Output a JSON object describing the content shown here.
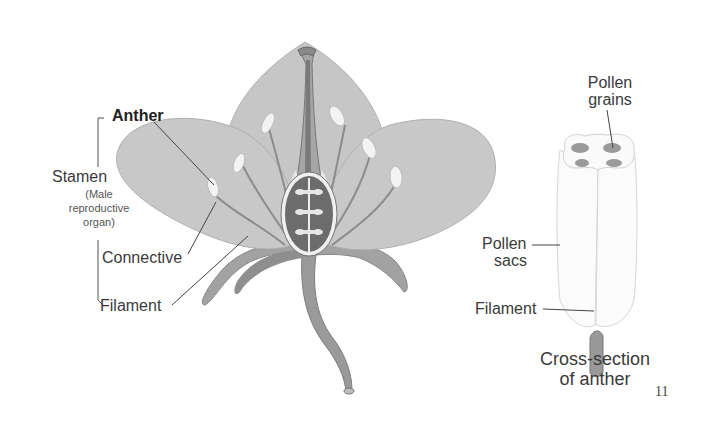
{
  "flower_diagram": {
    "labels": {
      "anther": "Anther",
      "stamen": "Stamen",
      "stamen_note_1": "(Male",
      "stamen_note_2": "reproductive",
      "stamen_note_3": "organ)",
      "connective": "Connective",
      "filament": "Filament"
    }
  },
  "anther_cross_section": {
    "labels": {
      "pollen_grains_1": "Pollen",
      "pollen_grains_2": "grains",
      "pollen_sacs_1": "Pollen",
      "pollen_sacs_2": "sacs",
      "filament": "Filament"
    },
    "caption_1": "Cross-section",
    "caption_2": "of anther"
  },
  "page_number": "11",
  "colors": {
    "petal": "#c8c8c8",
    "petal_dark": "#a9a9a9",
    "sepal": "#9d9d9d",
    "stem": "#9a9a9a",
    "ovary": "#6e6e6e",
    "anther": "#f2f2f2",
    "line": "#555555"
  }
}
